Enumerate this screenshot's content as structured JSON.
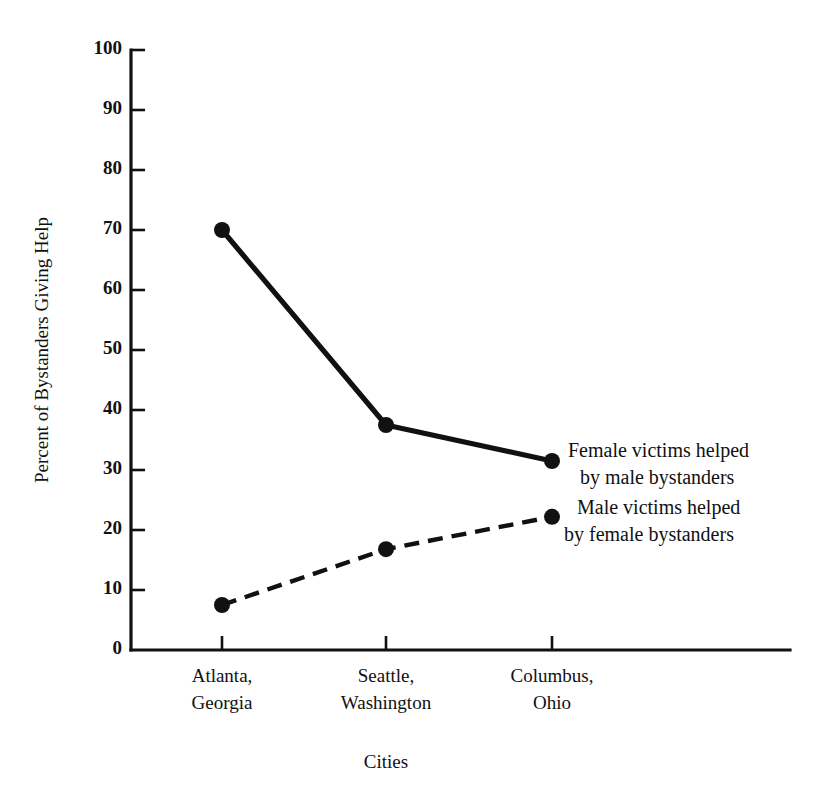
{
  "chart_data": {
    "type": "line",
    "title": "",
    "xlabel": "Cities",
    "ylabel": "Percent of Bystanders Giving Help",
    "categories": [
      "Atlanta, Georgia",
      "Seattle, Washington",
      "Columbus, Ohio"
    ],
    "category_lines": [
      [
        "Atlanta,",
        "Georgia"
      ],
      [
        "Seattle,",
        "Washington"
      ],
      [
        "Columbus,",
        "Ohio"
      ]
    ],
    "ylim": [
      0,
      100
    ],
    "ytick_values": [
      0,
      10,
      20,
      30,
      40,
      50,
      60,
      70,
      80,
      90,
      100
    ],
    "ytick_labels": [
      "0",
      "10",
      "20",
      "30",
      "40",
      "50",
      "60",
      "70",
      "80",
      "90",
      "100"
    ],
    "grid": false,
    "legend_position": "inline-right",
    "series": [
      {
        "name": "Female victims helped by male bystanders",
        "name_lines": [
          "Female victims helped",
          "by male bystanders"
        ],
        "style": "solid",
        "color": "#111111",
        "values": [
          70,
          37.5,
          31.5
        ]
      },
      {
        "name": "Male victims helped by female bystanders",
        "name_lines": [
          "Male victims helped",
          "by female bystanders"
        ],
        "style": "dashed",
        "color": "#111111",
        "values": [
          7.5,
          16.8,
          22.2
        ]
      }
    ]
  },
  "axes": {
    "y_title": "Percent of Bystanders Giving Help",
    "x_title": "Cities",
    "ytick_0": "0",
    "ytick_10": "10",
    "ytick_20": "20",
    "ytick_30": "30",
    "ytick_40": "40",
    "ytick_50": "50",
    "ytick_60": "60",
    "ytick_70": "70",
    "ytick_80": "80",
    "ytick_90": "90",
    "ytick_100": "100"
  },
  "xcats": {
    "cat0_line0": "Atlanta,",
    "cat0_line1": "Georgia",
    "cat1_line0": "Seattle,",
    "cat1_line1": "Washington",
    "cat2_line0": "Columbus,",
    "cat2_line1": "Ohio"
  },
  "legend": {
    "series0_line0": "Female victims helped",
    "series0_line1": "by male bystanders",
    "series1_line0": "Male victims helped",
    "series1_line1": "by female bystanders"
  }
}
